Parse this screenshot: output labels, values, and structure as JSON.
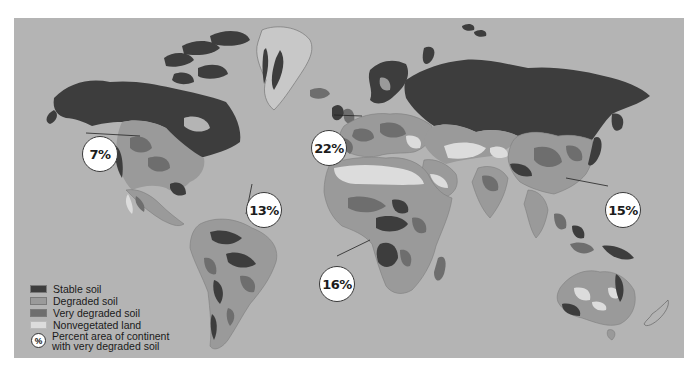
{
  "figure": {
    "type": "thematic world map"
  },
  "colors": {
    "ocean": "#b4b4b4",
    "stable_soil": "#3d3d3d",
    "degraded_soil": "#9a9a9a",
    "very_degraded_soil": "#6e6e6e",
    "nonvegetated_land": "#dcdcdc",
    "ice": "#c8c8c8",
    "callout_fill": "#ffffff"
  },
  "legend": {
    "items": [
      {
        "label": "Stable soil",
        "color": "#3d3d3d"
      },
      {
        "label": "Degraded soil",
        "color": "#9a9a9a"
      },
      {
        "label": "Very degraded soil",
        "color": "#6e6e6e"
      },
      {
        "label": "Nonvegetated land",
        "color": "#dcdcdc"
      }
    ],
    "percent_symbol": "%",
    "percent_line1": "Percent area of continent",
    "percent_line2": "with very degraded soil"
  },
  "callouts": [
    {
      "region": "North America",
      "value": "7%"
    },
    {
      "region": "Europe",
      "value": "22%"
    },
    {
      "region": "South America",
      "value": "13%"
    },
    {
      "region": "Africa",
      "value": "16%"
    },
    {
      "region": "Asia",
      "value": "15%"
    }
  ]
}
